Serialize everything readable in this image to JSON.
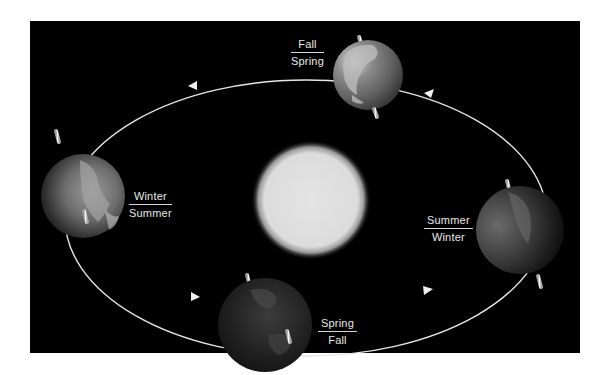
{
  "diagram": {
    "background_color": "#000000",
    "orbit_color": "#e6e6e6",
    "sun": {
      "label": "Sun",
      "color": "#e2e2e2"
    },
    "positions": [
      {
        "id": "top",
        "northern": "Fall",
        "southern": "Spring"
      },
      {
        "id": "left",
        "northern": "Winter",
        "southern": "Summer"
      },
      {
        "id": "bottom",
        "northern": "Spring",
        "southern": "Fall"
      },
      {
        "id": "right",
        "northern": "Summer",
        "southern": "Winter"
      }
    ],
    "orbit_direction": "counterclockwise"
  }
}
